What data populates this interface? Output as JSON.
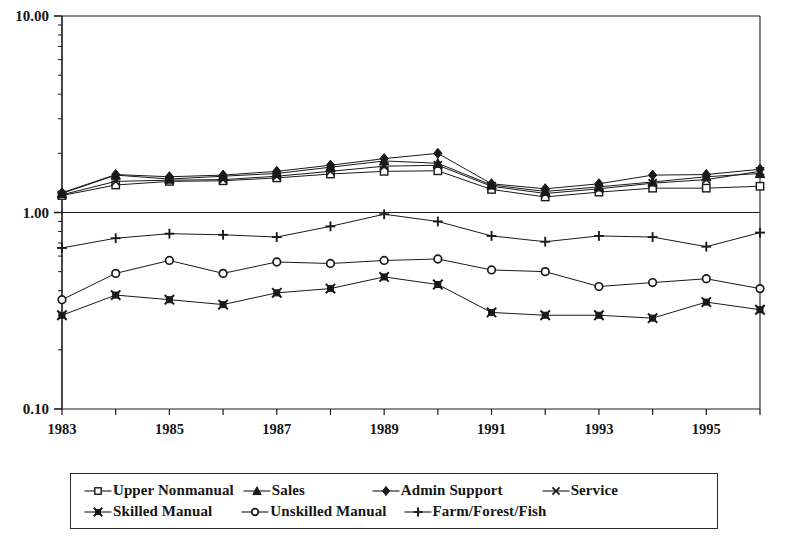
{
  "chart_data": {
    "type": "line",
    "title": "",
    "subtitle": "",
    "xlabel": "",
    "ylabel": "",
    "scale": "log",
    "grid": false,
    "legend_position": "bottom",
    "x": [
      1983,
      1984,
      1985,
      1986,
      1987,
      1988,
      1989,
      1990,
      1991,
      1992,
      1993,
      1994,
      1995,
      1996
    ],
    "x_tick_labels": [
      "1983",
      "",
      "1985",
      "",
      "1987",
      "",
      "1989",
      "",
      "1991",
      "",
      "1993",
      "",
      "1995",
      ""
    ],
    "y_tick_labels": [
      "10.00",
      "1.00",
      "0.10"
    ],
    "y_tick_values": [
      10.0,
      1.0,
      0.1
    ],
    "ylim": [
      0.1,
      10.0
    ],
    "xlim": [
      1983,
      1996
    ],
    "series": [
      {
        "name": "Upper Nonmanual",
        "marker": "open-square",
        "values": [
          1.22,
          1.38,
          1.44,
          1.45,
          1.5,
          1.57,
          1.62,
          1.63,
          1.31,
          1.2,
          1.27,
          1.33,
          1.33,
          1.36
        ]
      },
      {
        "name": "Sales",
        "marker": "filled-triangle",
        "values": [
          1.25,
          1.55,
          1.48,
          1.53,
          1.58,
          1.7,
          1.83,
          1.78,
          1.38,
          1.28,
          1.35,
          1.43,
          1.52,
          1.58
        ]
      },
      {
        "name": "Admin Support",
        "marker": "filled-diamond",
        "values": [
          1.26,
          1.56,
          1.52,
          1.55,
          1.62,
          1.74,
          1.88,
          2.0,
          1.4,
          1.32,
          1.4,
          1.55,
          1.56,
          1.66
        ]
      },
      {
        "name": "Service",
        "marker": "cross-x",
        "values": [
          1.23,
          1.44,
          1.46,
          1.47,
          1.53,
          1.62,
          1.72,
          1.74,
          1.36,
          1.25,
          1.32,
          1.41,
          1.47,
          1.62
        ]
      },
      {
        "name": "Skilled Manual",
        "marker": "filled-x-square",
        "values": [
          0.3,
          0.38,
          0.36,
          0.34,
          0.39,
          0.41,
          0.47,
          0.43,
          0.31,
          0.3,
          0.3,
          0.29,
          0.35,
          0.32
        ]
      },
      {
        "name": "Unskilled Manual",
        "marker": "open-circle",
        "values": [
          0.36,
          0.49,
          0.57,
          0.49,
          0.56,
          0.55,
          0.57,
          0.58,
          0.51,
          0.5,
          0.42,
          0.44,
          0.46,
          0.41
        ]
      },
      {
        "name": "Farm/Forest/Fish",
        "marker": "plus",
        "values": [
          0.66,
          0.74,
          0.78,
          0.77,
          0.75,
          0.85,
          0.98,
          0.9,
          0.76,
          0.71,
          0.76,
          0.75,
          0.67,
          0.79
        ]
      }
    ]
  },
  "legend": {
    "row1": [
      {
        "label": "Upper Nonmanual",
        "marker": "open-square"
      },
      {
        "label": "Sales",
        "marker": "filled-triangle"
      },
      {
        "label": "Admin Support",
        "marker": "filled-diamond"
      },
      {
        "label": "Service",
        "marker": "cross-x"
      }
    ],
    "row2": [
      {
        "label": "Skilled Manual",
        "marker": "filled-x-square"
      },
      {
        "label": "Unskilled Manual",
        "marker": "open-circle"
      },
      {
        "label": "Farm/Forest/Fish",
        "marker": "plus"
      }
    ]
  },
  "colors": {
    "line": "#1a1a1a",
    "axis": "#1a1a1a",
    "text": "#151515",
    "background": "#ffffff"
  }
}
